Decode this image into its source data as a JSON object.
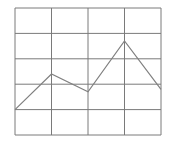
{
  "chart_data": {
    "type": "line",
    "title": "",
    "xlabel": "",
    "ylabel": "",
    "x": [
      0,
      1,
      2,
      3,
      4
    ],
    "series": [
      {
        "name": "series-1",
        "values": [
          1.0,
          2.4,
          1.7,
          3.7,
          1.8
        ]
      }
    ],
    "xlim": [
      0,
      4
    ],
    "ylim": [
      0,
      5
    ],
    "grid": true,
    "grid_columns": 4,
    "grid_rows": 5,
    "legend": "none"
  },
  "colors": {
    "grid": "#7a7a7a",
    "line": "#808080",
    "background": "#ffffff"
  }
}
